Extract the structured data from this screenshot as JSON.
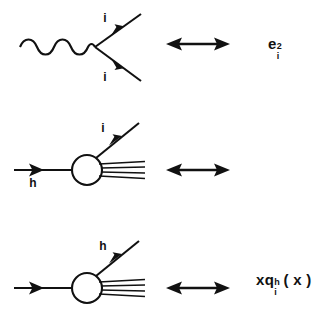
{
  "figure": {
    "background_color": "#ffffff",
    "ink_color": "#111111",
    "relation_symbol": "double-headed-arrow",
    "rows": [
      {
        "id": "coupling",
        "name": "photon-quark-coupling",
        "diagram": {
          "type": "feynman-vertex",
          "propagator": "wavy-photon-line",
          "legs": [
            {
              "name": "outgoing-fermion-upper",
              "label": "i",
              "arrow": "toward-vertex"
            },
            {
              "name": "outgoing-fermion-lower",
              "label": "i",
              "arrow": "toward-vertex"
            }
          ]
        },
        "formula": {
          "base": "e",
          "superscript": "2",
          "subscript": "i",
          "plain": "e_i^2"
        }
      },
      {
        "id": "structure",
        "name": "parton-distribution-function",
        "diagram": {
          "type": "blob-vertex",
          "blob": "hadron-blob",
          "incoming": {
            "name": "incoming-hadron",
            "label": "h",
            "arrow": "rightward"
          },
          "outgoing": {
            "name": "struck-quark",
            "label": "i",
            "arrow": "up-right"
          },
          "remnant": {
            "name": "hadron-remnant-lines",
            "count": 4
          }
        },
        "formula": {
          "prefix": "x",
          "base": "q",
          "superscript": "h",
          "subscript": "i",
          "argument": "( x )",
          "plain": "x q_i^h (x)"
        }
      },
      {
        "id": "fragment",
        "name": "fragmentation-function",
        "diagram": {
          "type": "blob-vertex",
          "blob": "hadron-blob",
          "incoming": {
            "name": "incoming-quark",
            "label": "",
            "arrow": "rightward"
          },
          "outgoing": {
            "name": "outgoing-hadron",
            "label": "h",
            "arrow": "up-right"
          },
          "remnant": {
            "name": "hadron-remnant-lines",
            "count": 4
          }
        },
        "formula": {
          "prefix": "z",
          "base": "D",
          "superscript": "h",
          "subscript": "q",
          "subscript_index": "i",
          "argument": "( z )",
          "plain": "z D_{q_i}^h (z)"
        }
      }
    ]
  }
}
